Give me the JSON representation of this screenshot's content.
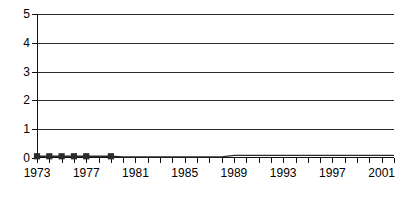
{
  "chart_data": {
    "type": "line",
    "title": "",
    "subtitle": "",
    "xlabel": "",
    "ylabel": "",
    "xlim": [
      1973,
      2002
    ],
    "ylim": [
      0,
      5
    ],
    "grid": true,
    "legend": false,
    "legend_position": "none",
    "y_ticks": [
      0,
      1,
      2,
      3,
      4,
      5
    ],
    "y_tick_labels": [
      "0",
      "1",
      "2",
      "3",
      "4",
      "5"
    ],
    "x_ticks": [
      1973,
      1974,
      1975,
      1976,
      1977,
      1978,
      1979,
      1980,
      1981,
      1982,
      1983,
      1984,
      1985,
      1986,
      1987,
      1988,
      1989,
      1990,
      1991,
      1992,
      1993,
      1994,
      1995,
      1996,
      1997,
      1998,
      1999,
      2000,
      2001,
      2002
    ],
    "x_tick_labels_shown": [
      "1973",
      "1977",
      "1981",
      "1985",
      "1989",
      "1993",
      "1997",
      "2001"
    ],
    "x_label_interval": 4,
    "line_color": "#2b2b2b",
    "marker_color": "#2b2b2b",
    "marker_shape": "square",
    "marker_years": [
      1973,
      1974,
      1975,
      1976,
      1977,
      1979
    ],
    "x": [
      1973,
      1974,
      1975,
      1976,
      1977,
      1978,
      1979,
      1980,
      1981,
      1982,
      1983,
      1984,
      1985,
      1986,
      1987,
      1988,
      1989,
      1990,
      1991,
      1992,
      1993,
      1994,
      1995,
      1996,
      1997,
      1998,
      1999,
      2000,
      2001,
      2002
    ],
    "values": [
      0.06,
      0.06,
      0.06,
      0.06,
      0.06,
      0.06,
      0.06,
      0.04,
      0.04,
      0.04,
      0.04,
      0.04,
      0.04,
      0.04,
      0.04,
      0.04,
      0.09,
      0.09,
      0.09,
      0.09,
      0.09,
      0.09,
      0.09,
      0.09,
      0.09,
      0.09,
      0.09,
      0.09,
      0.09,
      0.09
    ],
    "series": [
      {
        "name": "",
        "values": [
          0.06,
          0.06,
          0.06,
          0.06,
          0.06,
          0.06,
          0.06,
          0.04,
          0.04,
          0.04,
          0.04,
          0.04,
          0.04,
          0.04,
          0.04,
          0.04,
          0.09,
          0.09,
          0.09,
          0.09,
          0.09,
          0.09,
          0.09,
          0.09,
          0.09,
          0.09,
          0.09,
          0.09,
          0.09,
          0.09
        ]
      }
    ]
  }
}
